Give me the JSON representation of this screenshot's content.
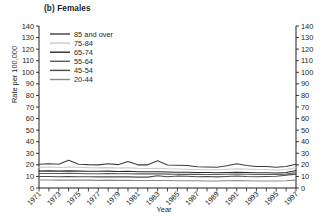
{
  "chart_data": {
    "type": "line",
    "title": "(b) Females",
    "xlabel": "Year",
    "ylabel": "Rate per 100,000",
    "xlim": [
      1971,
      1997
    ],
    "ylim": [
      0,
      140
    ],
    "ytick_step": 10,
    "yticks": [
      0,
      10,
      20,
      30,
      40,
      50,
      60,
      70,
      80,
      90,
      100,
      110,
      120,
      130,
      140
    ],
    "ytick_labels": [
      "0",
      "10",
      "20",
      "30",
      "40",
      "50",
      "60",
      "70",
      "80",
      "90",
      "100",
      "110",
      "120",
      "130",
      "140"
    ],
    "right_axis": true,
    "right_ytick_labels": [
      "0",
      "10",
      "20",
      "30",
      "40",
      "50",
      "60",
      "70",
      "80",
      "90",
      "100",
      "110",
      "120",
      "130",
      "140"
    ],
    "grid": false,
    "legend_position": "upper-left-inside",
    "x": [
      1971,
      1972,
      1973,
      1974,
      1975,
      1976,
      1977,
      1978,
      1979,
      1980,
      1981,
      1982,
      1983,
      1984,
      1985,
      1986,
      1987,
      1988,
      1989,
      1990,
      1991,
      1992,
      1993,
      1994,
      1995,
      1996,
      1997
    ],
    "xtick_labels": [
      "1971",
      "1973",
      "1975",
      "1977",
      "1979",
      "1981",
      "1983",
      "1985",
      "1987",
      "1989",
      "1991",
      "1993",
      "1995",
      "1997"
    ],
    "series": [
      {
        "name": "85 and over",
        "color": "#3d3d3d",
        "values": [
          20.5,
          21.0,
          20.6,
          24.0,
          20.6,
          20.2,
          20.0,
          21.0,
          20.2,
          23.0,
          20.0,
          20.0,
          23.5,
          19.8,
          19.6,
          19.4,
          18.4,
          18.2,
          18.0,
          19.2,
          21.0,
          19.4,
          18.6,
          18.6,
          18.0,
          18.6,
          20.6
        ]
      },
      {
        "name": "75-84",
        "color": "#c9c9c9",
        "values": [
          18.0,
          18.2,
          17.8,
          18.2,
          18.0,
          17.6,
          17.4,
          17.6,
          17.2,
          17.4,
          17.0,
          16.8,
          17.0,
          16.6,
          16.4,
          16.2,
          16.0,
          15.8,
          15.8,
          16.2,
          16.6,
          16.4,
          16.0,
          15.8,
          15.6,
          16.0,
          17.6
        ]
      },
      {
        "name": "65-74",
        "color": "#2b2b2b",
        "values": [
          14.6,
          14.8,
          14.6,
          14.8,
          14.6,
          14.4,
          14.4,
          14.6,
          14.2,
          14.4,
          14.0,
          14.0,
          14.0,
          13.8,
          13.6,
          13.6,
          13.4,
          13.4,
          13.2,
          13.4,
          13.6,
          13.4,
          13.2,
          13.2,
          13.0,
          13.4,
          15.2
        ]
      },
      {
        "name": "55-64",
        "color": "#5a5a5a",
        "values": [
          12.6,
          12.6,
          12.6,
          12.8,
          12.6,
          12.4,
          12.4,
          12.6,
          12.4,
          12.4,
          12.2,
          12.2,
          12.2,
          12.0,
          11.8,
          11.8,
          11.8,
          11.6,
          11.6,
          11.8,
          12.0,
          11.8,
          11.6,
          11.6,
          11.6,
          12.0,
          13.4
        ]
      },
      {
        "name": "45-54",
        "color": "#4a4a4a",
        "values": [
          10.0,
          10.0,
          9.8,
          10.0,
          9.8,
          9.8,
          9.6,
          9.8,
          9.6,
          9.6,
          9.4,
          9.4,
          10.6,
          9.8,
          10.4,
          10.2,
          9.8,
          10.0,
          9.6,
          10.0,
          10.4,
          10.0,
          9.8,
          10.0,
          10.2,
          11.0,
          12.0
        ]
      },
      {
        "name": "20-44",
        "color": "#8a8a8a",
        "values": [
          7.0,
          7.0,
          6.8,
          7.0,
          6.8,
          6.8,
          6.6,
          6.8,
          6.6,
          6.6,
          6.4,
          6.4,
          6.4,
          6.4,
          6.2,
          6.2,
          6.2,
          6.0,
          6.0,
          6.2,
          6.4,
          6.2,
          6.0,
          6.0,
          6.0,
          6.2,
          6.8
        ]
      }
    ]
  }
}
